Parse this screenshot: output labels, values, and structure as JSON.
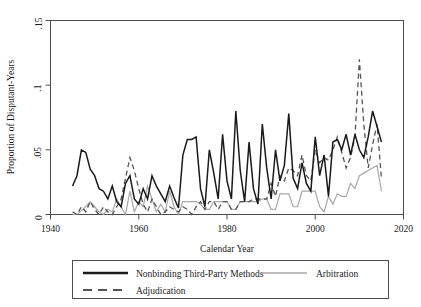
{
  "chart_data": {
    "type": "line",
    "title": "",
    "xlabel": "Calendar Year",
    "ylabel": "Proportion of Disputant-Years",
    "xlim": [
      1940,
      2020
    ],
    "ylim": [
      0,
      0.15
    ],
    "xticks": [
      1940,
      1960,
      1980,
      2000,
      2020
    ],
    "xtick_labels": [
      "1940",
      "1960",
      "1980",
      "2000",
      "2020"
    ],
    "yticks": [
      0,
      0.05,
      0.1,
      0.15
    ],
    "ytick_labels": [
      "0",
      ".05",
      ".1",
      ".15"
    ],
    "grid": false,
    "legend_position": "below-plot",
    "series": [
      {
        "name": "Nonbinding Third-Party Methods",
        "style": "solid",
        "color": "#1a1a1a",
        "width": 1.5,
        "x": [
          1945,
          1946,
          1947,
          1948,
          1949,
          1950,
          1951,
          1952,
          1953,
          1954,
          1955,
          1956,
          1957,
          1958,
          1959,
          1960,
          1961,
          1962,
          1963,
          1964,
          1965,
          1966,
          1967,
          1968,
          1969,
          1970,
          1971,
          1972,
          1973,
          1974,
          1975,
          1976,
          1977,
          1978,
          1979,
          1980,
          1981,
          1982,
          1983,
          1984,
          1985,
          1986,
          1987,
          1988,
          1989,
          1990,
          1991,
          1992,
          1993,
          1994,
          1995,
          1996,
          1997,
          1998,
          1999,
          2000,
          2001,
          2002,
          2003,
          2004,
          2005,
          2006,
          2007,
          2008,
          2009,
          2010,
          2011,
          2012,
          2013,
          2014,
          2015
        ],
        "values": [
          0.022,
          0.03,
          0.05,
          0.048,
          0.035,
          0.03,
          0.02,
          0.018,
          0.012,
          0.022,
          0.01,
          0.006,
          0.024,
          0.03,
          0.012,
          0.008,
          0.02,
          0.012,
          0.03,
          0.022,
          0.016,
          0.01,
          0.022,
          0.013,
          0.005,
          0.046,
          0.058,
          0.058,
          0.06,
          0.02,
          0.006,
          0.05,
          0.032,
          0.012,
          0.062,
          0.026,
          0.012,
          0.08,
          0.034,
          0.01,
          0.056,
          0.02,
          0.008,
          0.07,
          0.036,
          0.012,
          0.05,
          0.026,
          0.038,
          0.078,
          0.028,
          0.02,
          0.04,
          0.024,
          0.018,
          0.06,
          0.03,
          0.046,
          0.014,
          0.056,
          0.058,
          0.05,
          0.062,
          0.046,
          0.062,
          0.05,
          0.044,
          0.06,
          0.08,
          0.068,
          0.056
        ]
      },
      {
        "name": "Arbitration",
        "style": "solid",
        "color": "#a8a8a8",
        "width": 1.2,
        "x": [
          1945,
          1946,
          1947,
          1948,
          1949,
          1950,
          1951,
          1952,
          1953,
          1954,
          1955,
          1956,
          1957,
          1958,
          1959,
          1960,
          1961,
          1962,
          1963,
          1964,
          1965,
          1966,
          1967,
          1968,
          1969,
          1970,
          1971,
          1972,
          1973,
          1974,
          1975,
          1976,
          1977,
          1978,
          1979,
          1980,
          1981,
          1982,
          1983,
          1984,
          1985,
          1986,
          1987,
          1988,
          1989,
          1990,
          1991,
          1992,
          1993,
          1994,
          1995,
          1996,
          1997,
          1998,
          1999,
          2000,
          2001,
          2002,
          2003,
          2004,
          2005,
          2006,
          2007,
          2008,
          2009,
          2010,
          2011,
          2012,
          2013,
          2014,
          2015
        ],
        "values": [
          0.0,
          0.0,
          0.003,
          0.006,
          0.01,
          0.006,
          0.002,
          0.0,
          0.004,
          0.002,
          0.012,
          0.006,
          0.0,
          0.018,
          0.002,
          0.01,
          0.006,
          0.022,
          0.012,
          0.002,
          0.008,
          0.002,
          0.018,
          0.006,
          0.0,
          0.01,
          0.01,
          0.01,
          0.01,
          0.008,
          0.004,
          0.004,
          0.01,
          0.01,
          0.01,
          0.01,
          0.004,
          0.004,
          0.01,
          0.01,
          0.01,
          0.01,
          0.01,
          0.012,
          0.012,
          0.004,
          0.004,
          0.016,
          0.016,
          0.016,
          0.006,
          0.006,
          0.018,
          0.018,
          0.018,
          0.018,
          0.006,
          0.002,
          0.014,
          0.008,
          0.016,
          0.014,
          0.014,
          0.024,
          0.02,
          0.03,
          0.032,
          0.034,
          0.036,
          0.038,
          0.018
        ]
      },
      {
        "name": "Adjudication",
        "style": "dashed",
        "color": "#555555",
        "width": 1.3,
        "x": [
          1945,
          1946,
          1947,
          1948,
          1949,
          1950,
          1951,
          1952,
          1953,
          1954,
          1955,
          1956,
          1957,
          1958,
          1959,
          1960,
          1961,
          1962,
          1963,
          1964,
          1965,
          1966,
          1967,
          1968,
          1969,
          1970,
          1971,
          1972,
          1973,
          1974,
          1975,
          1976,
          1977,
          1978,
          1979,
          1980,
          1981,
          1982,
          1983,
          1984,
          1985,
          1986,
          1987,
          1988,
          1989,
          1990,
          1991,
          1992,
          1993,
          1994,
          1995,
          1996,
          1997,
          1998,
          1999,
          2000,
          2001,
          2002,
          2003,
          2004,
          2005,
          2006,
          2007,
          2008,
          2009,
          2010,
          2011,
          2012,
          2013,
          2014,
          2015
        ],
        "values": [
          0.002,
          0.0,
          0.006,
          0.002,
          0.01,
          0.004,
          0.0,
          0.006,
          0.002,
          0.0,
          0.006,
          0.012,
          0.028,
          0.044,
          0.034,
          0.02,
          0.008,
          0.002,
          0.012,
          0.006,
          0.0,
          0.002,
          0.006,
          0.004,
          0.002,
          0.006,
          0.004,
          0.0,
          0.006,
          0.01,
          0.004,
          0.01,
          0.01,
          0.004,
          0.01,
          0.01,
          0.004,
          0.004,
          0.01,
          0.01,
          0.01,
          0.012,
          0.012,
          0.012,
          0.012,
          0.024,
          0.014,
          0.03,
          0.026,
          0.036,
          0.034,
          0.03,
          0.046,
          0.03,
          0.026,
          0.05,
          0.04,
          0.044,
          0.042,
          0.05,
          0.06,
          0.048,
          0.036,
          0.044,
          0.06,
          0.12,
          0.07,
          0.036,
          0.054,
          0.07,
          0.028
        ]
      }
    ]
  },
  "legend": {
    "entries": [
      {
        "label": "Nonbinding Third-Party Methods",
        "style": "solid",
        "color": "#1a1a1a"
      },
      {
        "label": "Arbitration",
        "style": "solid",
        "color": "#a8a8a8"
      },
      {
        "label": "Adjudication",
        "style": "dashed",
        "color": "#555555"
      }
    ]
  }
}
